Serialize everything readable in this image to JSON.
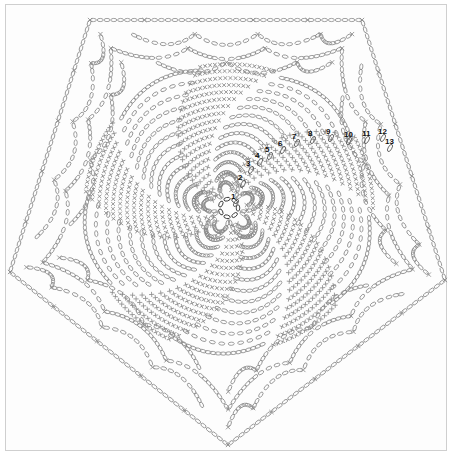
{
  "diagram": {
    "type": "crochet-chart",
    "shape": "pentagon",
    "colors": {
      "stitch": "#8a8a8a",
      "ring": "#222222",
      "label": "#111111",
      "frame": "#cfcfcf"
    },
    "center": {
      "x": 229,
      "y": 208,
      "ring_radius": 9
    },
    "vertices": [
      [
        90,
        20
      ],
      [
        362,
        20
      ],
      [
        445,
        280
      ],
      [
        228,
        445
      ],
      [
        10,
        272
      ]
    ],
    "round_labels": [
      {
        "text": "1",
        "x": 231,
        "y": 199
      },
      {
        "text": "2",
        "x": 238,
        "y": 180
      },
      {
        "text": "3",
        "x": 246,
        "y": 166
      },
      {
        "text": "4",
        "x": 255,
        "y": 158
      },
      {
        "text": "5",
        "x": 265,
        "y": 152
      },
      {
        "text": "6",
        "x": 278,
        "y": 146
      },
      {
        "text": "7",
        "x": 292,
        "y": 139
      },
      {
        "text": "8",
        "x": 308,
        "y": 136
      },
      {
        "text": "9",
        "x": 326,
        "y": 134
      },
      {
        "text": "10",
        "x": 344,
        "y": 137
      },
      {
        "text": "11",
        "x": 362,
        "y": 136
      },
      {
        "text": "12",
        "x": 378,
        "y": 134
      },
      {
        "text": "13",
        "x": 385,
        "y": 144
      }
    ],
    "legend_symbols": {
      "chain": "oval",
      "single_crochet": "cross",
      "double_crochet": "plus"
    }
  }
}
